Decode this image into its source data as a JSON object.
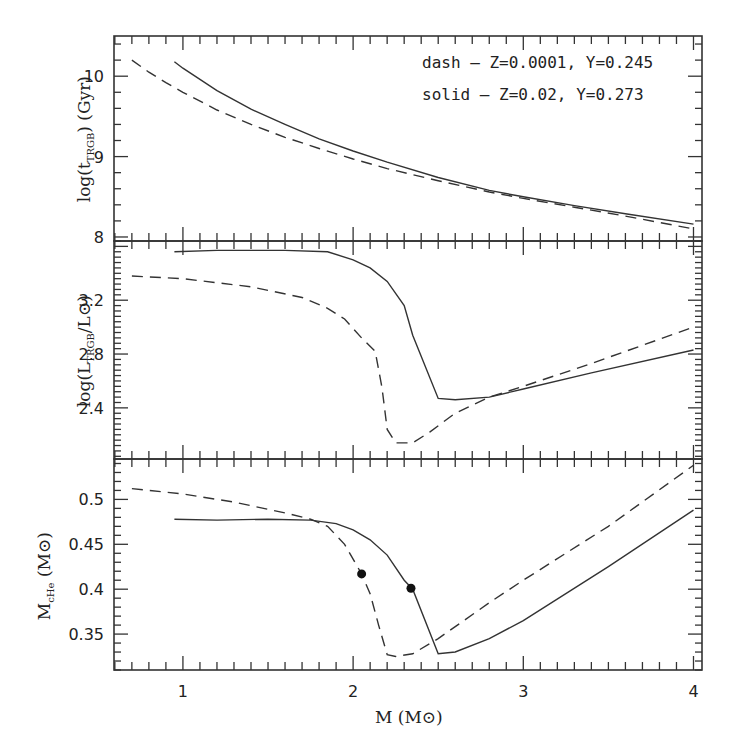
{
  "chart_data": [
    {
      "type": "line",
      "panel": "top",
      "ylabel": "log(t_TRGB) (Gyr)",
      "xlabel": "",
      "xlim": [
        0.6,
        4.05
      ],
      "ylim": [
        7.95,
        10.5
      ],
      "yticks": [
        8,
        9,
        10
      ],
      "legend": [
        {
          "style": "dash",
          "text": "dash – Z=0.0001, Y=0.245"
        },
        {
          "style": "solid",
          "text": "solid – Z=0.02, Y=0.273"
        }
      ],
      "series": [
        {
          "name": "dash - Z=0.0001, Y=0.245",
          "style": "dashed",
          "x": [
            0.7,
            0.8,
            0.9,
            1.0,
            1.2,
            1.4,
            1.6,
            1.8,
            2.0,
            2.2,
            2.5,
            2.8,
            3.0,
            3.3,
            3.6,
            4.0
          ],
          "y": [
            10.2,
            10.05,
            9.92,
            9.8,
            9.58,
            9.4,
            9.24,
            9.1,
            8.97,
            8.85,
            8.7,
            8.56,
            8.48,
            8.37,
            8.26,
            8.1
          ]
        },
        {
          "name": "solid - Z=0.02, Y=0.273",
          "style": "solid",
          "x": [
            0.95,
            1.0,
            1.2,
            1.4,
            1.6,
            1.8,
            2.0,
            2.2,
            2.5,
            2.8,
            3.0,
            3.3,
            3.6,
            4.0
          ],
          "y": [
            10.18,
            10.1,
            9.82,
            9.59,
            9.4,
            9.22,
            9.07,
            8.93,
            8.74,
            8.58,
            8.5,
            8.39,
            8.29,
            8.16
          ]
        }
      ]
    },
    {
      "type": "line",
      "panel": "middle",
      "ylabel": "log(L_TRGB/L⊙)",
      "xlabel": "",
      "xlim": [
        0.6,
        4.05
      ],
      "ylim": [
        2.02,
        3.64
      ],
      "yticks": [
        2.4,
        2.8,
        3.2
      ],
      "series": [
        {
          "name": "dash - Z=0.0001, Y=0.245",
          "style": "dashed",
          "x": [
            0.7,
            1.0,
            1.4,
            1.7,
            1.85,
            1.95,
            2.05,
            2.13,
            2.17,
            2.2,
            2.25,
            2.35,
            2.45,
            2.6,
            2.8,
            3.0,
            3.4,
            4.0
          ],
          "y": [
            3.38,
            3.36,
            3.3,
            3.22,
            3.14,
            3.06,
            2.92,
            2.82,
            2.55,
            2.24,
            2.14,
            2.14,
            2.22,
            2.36,
            2.48,
            2.56,
            2.73,
            3.0
          ]
        },
        {
          "name": "solid - Z=0.02, Y=0.273",
          "style": "solid",
          "x": [
            0.95,
            1.2,
            1.6,
            1.85,
            2.0,
            2.1,
            2.2,
            2.3,
            2.35,
            2.5,
            2.6,
            2.8,
            3.0,
            3.4,
            4.0
          ],
          "y": [
            3.56,
            3.57,
            3.57,
            3.56,
            3.5,
            3.44,
            3.34,
            3.16,
            2.94,
            2.47,
            2.46,
            2.48,
            2.54,
            2.66,
            2.83
          ]
        }
      ]
    },
    {
      "type": "line",
      "panel": "bottom",
      "ylabel": "M_cHe (M⊙)",
      "xlabel": "M (M⊙)",
      "xlim": [
        0.6,
        4.05
      ],
      "ylim": [
        0.31,
        0.545
      ],
      "xticks": [
        1,
        2,
        3,
        4
      ],
      "yticks": [
        0.35,
        0.4,
        0.45,
        0.5
      ],
      "series": [
        {
          "name": "dash - Z=0.0001, Y=0.245",
          "style": "dashed",
          "x": [
            0.7,
            1.0,
            1.3,
            1.6,
            1.75,
            1.85,
            1.95,
            2.05,
            2.1,
            2.15,
            2.2,
            2.25,
            2.35,
            2.5,
            2.8,
            3.0,
            3.5,
            4.0
          ],
          "y": [
            0.512,
            0.506,
            0.497,
            0.485,
            0.478,
            0.47,
            0.45,
            0.417,
            0.395,
            0.36,
            0.327,
            0.325,
            0.328,
            0.345,
            0.385,
            0.41,
            0.47,
            0.538
          ]
        },
        {
          "name": "solid - Z=0.02, Y=0.273",
          "style": "solid",
          "x": [
            0.95,
            1.2,
            1.5,
            1.75,
            1.9,
            2.0,
            2.1,
            2.2,
            2.3,
            2.35,
            2.5,
            2.6,
            2.8,
            3.0,
            3.5,
            4.0
          ],
          "y": [
            0.478,
            0.477,
            0.478,
            0.477,
            0.473,
            0.466,
            0.455,
            0.438,
            0.41,
            0.4,
            0.328,
            0.33,
            0.345,
            0.365,
            0.425,
            0.488
          ]
        }
      ],
      "markers": [
        {
          "x": 2.05,
          "y": 0.417,
          "series": "dash"
        },
        {
          "x": 2.34,
          "y": 0.401,
          "series": "solid"
        }
      ]
    }
  ],
  "labels": {
    "panel_top_ylabel_main": "log(t",
    "panel_top_ylabel_sub": "TRGB",
    "panel_top_ylabel_tail": ") (Gyr)",
    "panel_mid_ylabel_main": "log(L",
    "panel_mid_ylabel_sub": "TRGB",
    "panel_mid_ylabel_tail": "/L⊙)",
    "panel_bot_ylabel_main": "M",
    "panel_bot_ylabel_sub": "cHe",
    "panel_bot_ylabel_tail": " (M⊙)",
    "xlabel": "M (M⊙)",
    "legend_dash": "dash – Z=0.0001, Y=0.245",
    "legend_solid": "solid – Z=0.02, Y=0.273"
  }
}
